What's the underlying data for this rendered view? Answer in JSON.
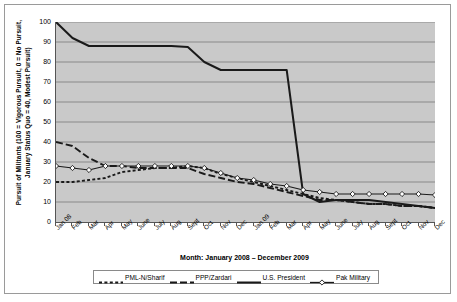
{
  "chart_data": {
    "type": "line",
    "title": "",
    "xlabel": "Month: January 2008 – December 2009",
    "ylabel": "Pursuit of Militants (100 = Vigorous Pursuit, 0 = No Pursuit, January Status Quo = 40, Modest Pursuit)",
    "ylim": [
      0,
      100
    ],
    "ytick_values": [
      100,
      90,
      80,
      70,
      60,
      50,
      40,
      30,
      20,
      10,
      0
    ],
    "ytick_labels": [
      "100",
      "90",
      "80",
      "70",
      "60",
      "50",
      "40",
      "30",
      "20",
      "10",
      "0"
    ],
    "grid": true,
    "grid_axis": "y",
    "legend_position": "bottom",
    "plot_background": "#c9c9c9",
    "categories": [
      "Jan 08",
      "Feb",
      "Mar",
      "Apr",
      "May",
      "June",
      "July",
      "Aug",
      "Sept",
      "Oct",
      "Nov",
      "Dec",
      "Jan 09",
      "Feb",
      "Mar",
      "Apr",
      "May",
      "June",
      "July",
      "Aug",
      "Sept",
      "Oct",
      "Nov",
      "Dec"
    ],
    "series": [
      {
        "name": "PML-N/Sharif",
        "style": "dotted",
        "marker": "none",
        "color": "#1a1a1a",
        "values": [
          20,
          20,
          21,
          22,
          25,
          26,
          27,
          27,
          28,
          27,
          24,
          22,
          20,
          18,
          16,
          14,
          12,
          11,
          10,
          9,
          9,
          8,
          8,
          7
        ]
      },
      {
        "name": "PPP/Zardari",
        "style": "dashed",
        "marker": "none",
        "color": "#1a1a1a",
        "values": [
          40,
          38,
          32,
          28,
          28,
          27,
          27,
          27,
          27,
          24,
          22,
          20,
          19,
          17,
          15,
          13,
          11,
          11,
          10,
          9,
          9,
          8,
          8,
          7
        ]
      },
      {
        "name": "U.S. President",
        "style": "solid",
        "marker": "none",
        "color": "#1a1a1a",
        "values": [
          100,
          92,
          88,
          88,
          88,
          88,
          88,
          88,
          87.5,
          80,
          76,
          76,
          76,
          76,
          76,
          14,
          10,
          11,
          11,
          11,
          10,
          9,
          8,
          7
        ]
      },
      {
        "name": "Pak Military",
        "style": "solid",
        "marker": "diamond",
        "color": "#1a1a1a",
        "values": [
          28,
          27,
          26,
          28,
          28,
          28,
          28,
          28,
          28,
          27,
          24.5,
          22,
          21,
          19,
          18,
          16,
          15,
          14,
          14,
          14,
          14,
          14,
          14,
          13.5
        ]
      }
    ],
    "legend": [
      {
        "label": "PML-N/Sharif",
        "swatch": "dotted"
      },
      {
        "label": "PPP/Zardari",
        "swatch": "dashed"
      },
      {
        "label": "U.S. President",
        "swatch": "solid"
      },
      {
        "label": "Pak Military",
        "swatch": "solid-diamond"
      }
    ]
  }
}
